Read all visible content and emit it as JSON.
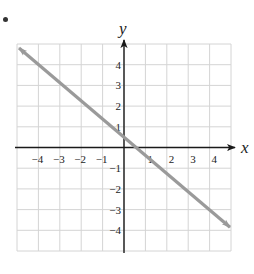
{
  "chart_data": {
    "type": "line",
    "title": "",
    "xlabel": "x",
    "ylabel": "y",
    "xlim": [
      -5,
      5
    ],
    "ylim": [
      -5,
      5
    ],
    "grid": true,
    "x_ticks": [
      -4,
      -3,
      -2,
      -1,
      1,
      2,
      3,
      4
    ],
    "y_ticks": [
      -4,
      -3,
      -2,
      -1,
      1,
      2,
      3,
      4
    ],
    "x_tick_labels": [
      "−4",
      "−3",
      "−2",
      "−1",
      "1",
      "2",
      "3",
      "4"
    ],
    "y_tick_labels": [
      "−4",
      "−3",
      "−2",
      "−1",
      "1",
      "2",
      "3",
      "4"
    ],
    "series": [
      {
        "name": "line",
        "x": [
          -5,
          5
        ],
        "y": [
          4.9,
          -3.85
        ],
        "slope": -0.875,
        "y_intercept": 0.55,
        "x_intercept": 0.63,
        "arrows_both_ends": true
      }
    ]
  },
  "colors": {
    "grid": "#d4d4d4",
    "axis": "#1a1a1a",
    "line": "#9a9a9a",
    "text": "#222222"
  },
  "layout": {
    "plot_left": 17,
    "plot_top": 44,
    "plot_right": 231,
    "plot_bottom": 251,
    "origin_x": 124,
    "origin_y": 147
  }
}
